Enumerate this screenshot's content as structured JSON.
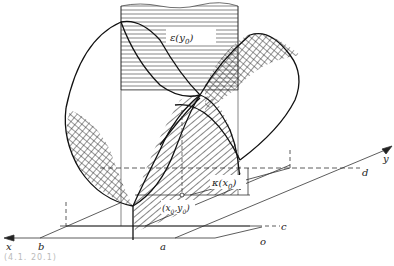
{
  "figure": {
    "type": "3d-surface-diagram",
    "surface_labels": {
      "epsilon": "ε(y",
      "epsilon_sub": "0",
      "kappa": "κ(x",
      "kappa_sub": "0",
      "point": "(x",
      "point_sub0": "0",
      "point_sep": ",y",
      "point_sub1": "0"
    },
    "axes": {
      "x": "x",
      "y": "y"
    },
    "ground_points": {
      "a": "a",
      "b": "b",
      "c": "c",
      "d": "d",
      "o": "o"
    },
    "caption": "(4.1.  20.1)",
    "colors": {
      "ink": "#222222",
      "background": "#ffffff"
    }
  }
}
